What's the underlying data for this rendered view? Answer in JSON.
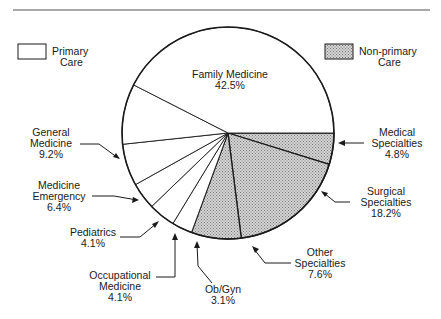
{
  "chart_data": {
    "type": "pie",
    "title": "",
    "legend": {
      "position": "top",
      "entries": [
        {
          "label_line1": "Primary",
          "label_line2": "Care",
          "fill": "plain",
          "color": "#ffffff"
        },
        {
          "label_line1": "Non-primary",
          "label_line2": "Care",
          "fill": "hatched",
          "color": "#b8b8b8"
        }
      ]
    },
    "slices": [
      {
        "name_line1": "Medical",
        "name_line2": "Specialties",
        "value": 4.8,
        "value_label": "4.8%",
        "group": "Non-primary Care"
      },
      {
        "name_line1": "Surgical",
        "name_line2": "Specialties",
        "value": 18.2,
        "value_label": "18.2%",
        "group": "Non-primary Care"
      },
      {
        "name_line1": "Other",
        "name_line2": "Specialties",
        "value": 7.6,
        "value_label": "7.6%",
        "group": "Non-primary Care"
      },
      {
        "name_line1": "Ob/Gyn",
        "name_line2": "",
        "value": 3.1,
        "value_label": "3.1%",
        "group": "Primary Care"
      },
      {
        "name_line1": "Occupational",
        "name_line2": "Medicine",
        "value": 4.1,
        "value_label": "4.1%",
        "group": "Primary Care"
      },
      {
        "name_line1": "Pediatrics",
        "name_line2": "",
        "value": 4.1,
        "value_label": "4.1%",
        "group": "Primary Care"
      },
      {
        "name_line1": "Medicine",
        "name_line2": "Emergency",
        "value": 6.4,
        "value_label": "6.4%",
        "group": "Primary Care"
      },
      {
        "name_line1": "General",
        "name_line2": "Medicine",
        "value": 9.2,
        "value_label": "9.2%",
        "group": "Primary Care"
      },
      {
        "name_line1": "Family Medicine",
        "name_line2": "",
        "value": 42.5,
        "value_label": "42.5%",
        "group": "Primary Care"
      }
    ],
    "colors": {
      "primary": "#ffffff",
      "non_primary": "#b8b8b8",
      "stroke": "#1a1a1a"
    }
  }
}
